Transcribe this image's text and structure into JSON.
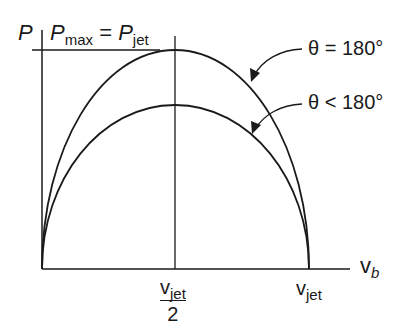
{
  "diagram": {
    "y_axis_label": "P",
    "title": {
      "lhs_main": "P",
      "lhs_sub": "max",
      "equals": "=",
      "rhs_main": "P",
      "rhs_sub": "jet"
    },
    "x_axis_label": {
      "main": "v",
      "sub": "b"
    },
    "x_ticks": [
      {
        "num_main": "v",
        "num_sub": "jet",
        "den": "2"
      },
      {
        "main": "v",
        "sub": "jet"
      }
    ],
    "curves": [
      {
        "label": "θ = 180°",
        "peak_fraction": 1.0
      },
      {
        "label": "θ < 180°",
        "peak_fraction": 0.74
      }
    ],
    "line_color": "#1a1a1a"
  }
}
